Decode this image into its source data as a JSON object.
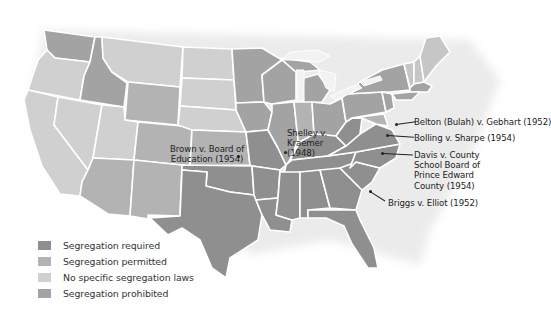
{
  "colors": {
    "segregation_required": "#8f8f8f",
    "segregation_permitted": "#b3b3b3",
    "no_specific_laws": "#d0d0d0",
    "segregation_prohibited": "#a3a3a3",
    "border": "#ffffff"
  },
  "legend": {
    "items": [
      {
        "label": "Segregation required",
        "color": "#8f8f8f"
      },
      {
        "label": "Segregation permitted",
        "color": "#b3b3b3"
      },
      {
        "label": "No specific segregation laws",
        "color": "#d0d0d0"
      },
      {
        "label": "Segregation prohibited",
        "color": "#a3a3a3"
      }
    ]
  },
  "cases": {
    "brown": {
      "line1": "Brown v. Board of",
      "line2": "Education (1954)"
    },
    "shelley": {
      "line1": "Shelley v.",
      "line2": "Kraemer",
      "line3": "(1948)"
    },
    "belton": {
      "line1": "Belton (Bulah) v. Gebhart (1952)"
    },
    "bolling": {
      "line1": "Bolling v. Sharpe (1954)"
    },
    "davis": {
      "line1": "Davis v. County",
      "line2": "School Board of",
      "line3": "Prince Edward",
      "line4": "County (1954)"
    },
    "briggs": {
      "line1": "Briggs v. Elliot (1952)"
    }
  }
}
